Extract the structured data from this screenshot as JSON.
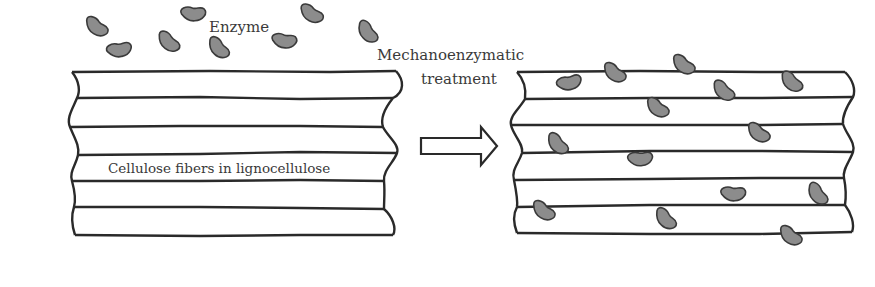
{
  "diagram": {
    "type": "process-schematic",
    "labels": {
      "enzyme": "Enzyme",
      "process_line1": "Mechanoenzymatic",
      "process_line2": "treatment",
      "fibers": "Cellulose fibers in lignocellulose"
    },
    "colors": {
      "line": "#2a2a2a",
      "enzyme_fill": "#8c8c8c",
      "enzyme_stroke": "#3a3a3a",
      "text": "#3a3a3a",
      "background": "#ffffff"
    },
    "panels": [
      {
        "name": "before",
        "fiber_layers": 6,
        "enzymes_on_fibers": 0
      },
      {
        "name": "after",
        "fiber_layers": 6,
        "enzymes_on_fibers": 16
      }
    ],
    "free_enzymes_count": 9,
    "arrow": {
      "direction": "right"
    }
  }
}
